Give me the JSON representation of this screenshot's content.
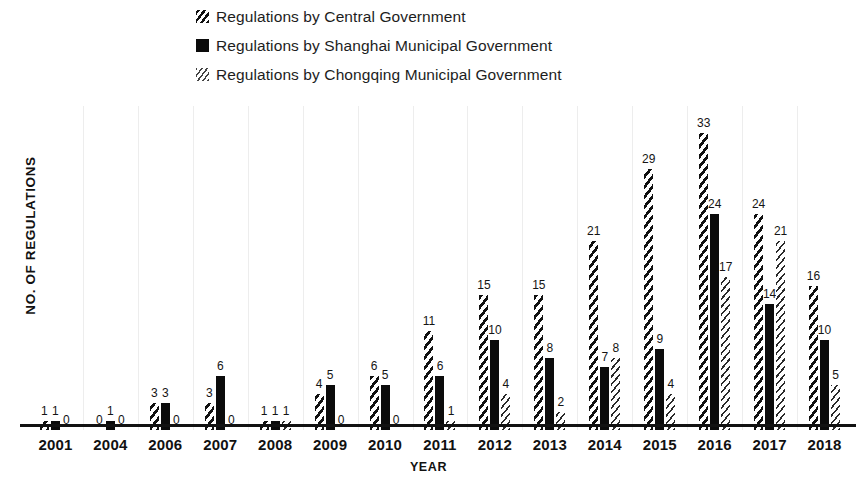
{
  "legend": {
    "position": "top-left",
    "items": [
      {
        "label": "Regulations by Central Government",
        "key": "central",
        "pattern": "diagonal-hatch",
        "color": "#111111"
      },
      {
        "label": "Regulations by Shanghai Municipal Government",
        "key": "shanghai",
        "pattern": "solid",
        "color": "#0b0b0b"
      },
      {
        "label": "Regulations by Chongqing Municipal Government",
        "key": "chongqing",
        "pattern": "dotted-hatch",
        "color": "#2a2a2a"
      }
    ]
  },
  "axes": {
    "y_label": "NO. OF REGULATIONS",
    "x_label": "YEAR"
  },
  "chart_data": {
    "type": "bar",
    "title": "",
    "subtitle": "",
    "xlabel": "YEAR",
    "ylabel": "NO. OF REGULATIONS",
    "ylim": [
      0,
      36
    ],
    "grid": "vertical-faint",
    "legend_position": "top-left",
    "data_labels": true,
    "categories": [
      "2001",
      "2004",
      "2006",
      "2007",
      "2008",
      "2009",
      "2010",
      "2011",
      "2012",
      "2013",
      "2014",
      "2015",
      "2016",
      "2017",
      "2018"
    ],
    "series": [
      {
        "name": "Regulations by Central Government",
        "pattern": "diagonal-hatch",
        "values": [
          1,
          0,
          3,
          3,
          1,
          4,
          6,
          11,
          15,
          15,
          21,
          29,
          33,
          24,
          16
        ]
      },
      {
        "name": "Regulations by Shanghai Municipal Government",
        "pattern": "solid",
        "values": [
          1,
          1,
          3,
          6,
          1,
          5,
          5,
          6,
          10,
          8,
          7,
          9,
          24,
          14,
          10
        ]
      },
      {
        "name": "Regulations by Chongqing Municipal Government",
        "pattern": "dotted-hatch",
        "values": [
          0,
          0,
          0,
          0,
          1,
          0,
          0,
          1,
          4,
          2,
          8,
          4,
          17,
          21,
          5
        ]
      }
    ]
  }
}
